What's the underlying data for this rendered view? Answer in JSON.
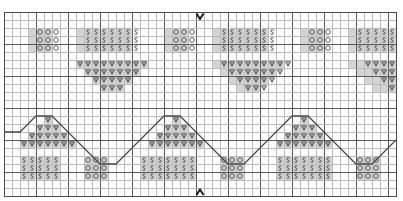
{
  "chart": {
    "type": "knitting-chart",
    "grid": {
      "columns": 49,
      "rows": 23,
      "cell_size": 8,
      "origin_x": 4,
      "origin_y": 12,
      "gridline_color": "#b9b9b9",
      "major_gridline_color": "#5a5a5a",
      "border_color": "#4a4a4a",
      "shaded_cell_color": "#d4d4d4",
      "background_color": "#ffffff",
      "major_every": 4
    },
    "symbols": {
      "yarn_over": {
        "name": "o",
        "glyph": "circle",
        "label": "yarn over"
      },
      "slip_stitch": {
        "name": "s",
        "glyph": "s-shape",
        "label": "slip stitch"
      },
      "decrease": {
        "name": "v",
        "glyph": "inverted-triangle",
        "label": "decrease"
      }
    },
    "markers": {
      "top": {
        "glyph": "V",
        "name": "repeat-start-marker",
        "col": 24,
        "row": 0
      },
      "bottom": {
        "glyph": "A",
        "name": "repeat-end-marker",
        "col": 24,
        "row": 22
      }
    },
    "zigzag": {
      "color": "#4a4a4a",
      "width": 1.3,
      "points": "0,15 2,15 4,13 6,13 8,15 10,17 12,19 14,19 16,17 18,15 20,13 22,13 24,15 26,17 28,19 30,19 32,17 34,15 36,13 38,13 40,15 42,17 44,19 46,19 48,17 49,16"
    },
    "rows": [
      {
        "index": 0,
        "cells": ""
      },
      {
        "index": 1,
        "cells": ""
      },
      {
        "index": 2,
        "cells": "....ooo...sssssss....ooo...sssssss....ooo...sssss"
      },
      {
        "index": 3,
        "cells": "....ooo...sssssss....ooo...sssssss....ooo...sssss"
      },
      {
        "index": 4,
        "cells": "....ooo...sssssss....ooo...sssssss....ooo...sssss"
      },
      {
        "index": 5,
        "cells": ""
      },
      {
        "index": 6,
        "cells": ".........vvvvvvvvv.........vvvvvvvvv.........vvvv"
      },
      {
        "index": 7,
        "cells": "..........vvvvvvv...........vvvvvvv...........vvv"
      },
      {
        "index": 8,
        "cells": "...........vvvvv.............vvvvv.............vv"
      },
      {
        "index": 9,
        "cells": "............vvv...............vvv...............v"
      },
      {
        "index": 10,
        "cells": ""
      },
      {
        "index": 11,
        "cells": ""
      },
      {
        "index": 12,
        "cells": ""
      },
      {
        "index": 13,
        "cells": ".....v...............v...............v..........."
      },
      {
        "index": 14,
        "cells": "....vvv.............vvv.............vvv.........."
      },
      {
        "index": 15,
        "cells": "...vvvvv...........vvvvv...........vvvvv........."
      },
      {
        "index": 16,
        "cells": "..vvvvvvv.........vvvvvvv.........vvvvvvv........"
      },
      {
        "index": 17,
        "cells": ""
      },
      {
        "index": 18,
        "cells": "..sssss...ooo....sssssss...ooo....sssssss...ooo.."
      },
      {
        "index": 19,
        "cells": "..sssss...ooo....sssssss...ooo....sssssss...ooo.."
      },
      {
        "index": 20,
        "cells": "..sssss...ooo....sssssss...ooo....sssssss...ooo.."
      },
      {
        "index": 21,
        "cells": ""
      },
      {
        "index": 22,
        "cells": ""
      }
    ],
    "blocks": [
      {
        "name": "top-yo-block-1",
        "symbol": "o",
        "col": 3,
        "row": 2,
        "w": 3,
        "h": 3
      },
      {
        "name": "top-slip-block-1",
        "symbol": "s",
        "col": 9,
        "row": 2,
        "w": 7,
        "h": 3
      },
      {
        "name": "top-yo-block-2",
        "symbol": "o",
        "col": 20,
        "row": 2,
        "w": 3,
        "h": 3
      },
      {
        "name": "top-slip-block-2",
        "symbol": "s",
        "col": 26,
        "row": 2,
        "w": 7,
        "h": 3
      },
      {
        "name": "top-yo-block-3",
        "symbol": "o",
        "col": 37,
        "row": 2,
        "w": 3,
        "h": 3
      },
      {
        "name": "top-slip-block-3",
        "symbol": "s",
        "col": 43,
        "row": 2,
        "w": 6,
        "h": 3
      },
      {
        "name": "upper-dec-tri-1",
        "symbol": "v",
        "col": 9,
        "row": 6,
        "w": 9,
        "h": 1
      },
      {
        "name": "upper-dec-tri-1b",
        "symbol": "v",
        "col": 10,
        "row": 7,
        "w": 7,
        "h": 1
      },
      {
        "name": "upper-dec-tri-1c",
        "symbol": "v",
        "col": 11,
        "row": 8,
        "w": 5,
        "h": 1
      },
      {
        "name": "upper-dec-tri-1d",
        "symbol": "v",
        "col": 12,
        "row": 9,
        "w": 3,
        "h": 1
      },
      {
        "name": "upper-dec-tri-2",
        "symbol": "v",
        "col": 26,
        "row": 6,
        "w": 9,
        "h": 1
      },
      {
        "name": "upper-dec-tri-2b",
        "symbol": "v",
        "col": 27,
        "row": 7,
        "w": 7,
        "h": 1
      },
      {
        "name": "upper-dec-tri-2c",
        "symbol": "v",
        "col": 28,
        "row": 8,
        "w": 5,
        "h": 1
      },
      {
        "name": "upper-dec-tri-2d",
        "symbol": "v",
        "col": 29,
        "row": 9,
        "w": 3,
        "h": 1
      },
      {
        "name": "upper-dec-tri-3",
        "symbol": "v",
        "col": 43,
        "row": 6,
        "w": 6,
        "h": 1
      },
      {
        "name": "upper-dec-tri-3b",
        "symbol": "v",
        "col": 44,
        "row": 7,
        "w": 5,
        "h": 1
      },
      {
        "name": "upper-dec-tri-3c",
        "symbol": "v",
        "col": 45,
        "row": 8,
        "w": 4,
        "h": 1
      },
      {
        "name": "upper-dec-tri-3d",
        "symbol": "v",
        "col": 46,
        "row": 9,
        "w": 3,
        "h": 1
      },
      {
        "name": "lower-dec-tri-1",
        "symbol": "v",
        "col": 5,
        "row": 13,
        "w": 1,
        "h": 1
      },
      {
        "name": "lower-dec-tri-1b",
        "symbol": "v",
        "col": 4,
        "row": 14,
        "w": 3,
        "h": 1
      },
      {
        "name": "lower-dec-tri-1c",
        "symbol": "v",
        "col": 3,
        "row": 15,
        "w": 5,
        "h": 1
      },
      {
        "name": "lower-dec-tri-1d",
        "symbol": "v",
        "col": 2,
        "row": 16,
        "w": 7,
        "h": 1
      },
      {
        "name": "lower-dec-tri-2",
        "symbol": "v",
        "col": 21,
        "row": 13,
        "w": 1,
        "h": 1
      },
      {
        "name": "lower-dec-tri-2b",
        "symbol": "v",
        "col": 20,
        "row": 14,
        "w": 3,
        "h": 1
      },
      {
        "name": "lower-dec-tri-2c",
        "symbol": "v",
        "col": 19,
        "row": 15,
        "w": 5,
        "h": 1
      },
      {
        "name": "lower-dec-tri-2d",
        "symbol": "v",
        "col": 18,
        "row": 16,
        "w": 7,
        "h": 1
      },
      {
        "name": "lower-dec-tri-3",
        "symbol": "v",
        "col": 37,
        "row": 13,
        "w": 1,
        "h": 1
      },
      {
        "name": "lower-dec-tri-3b",
        "symbol": "v",
        "col": 36,
        "row": 14,
        "w": 3,
        "h": 1
      },
      {
        "name": "lower-dec-tri-3c",
        "symbol": "v",
        "col": 35,
        "row": 15,
        "w": 5,
        "h": 1
      },
      {
        "name": "lower-dec-tri-3d",
        "symbol": "v",
        "col": 34,
        "row": 16,
        "w": 7,
        "h": 1
      },
      {
        "name": "bottom-slip-block-1",
        "symbol": "s",
        "col": 2,
        "row": 18,
        "w": 5,
        "h": 3
      },
      {
        "name": "bottom-yo-block-1",
        "symbol": "o",
        "col": 10,
        "row": 18,
        "w": 3,
        "h": 3
      },
      {
        "name": "bottom-slip-block-2",
        "symbol": "s",
        "col": 17,
        "row": 18,
        "w": 7,
        "h": 3
      },
      {
        "name": "bottom-yo-block-2",
        "symbol": "o",
        "col": 27,
        "row": 18,
        "w": 3,
        "h": 3
      },
      {
        "name": "bottom-slip-block-3",
        "symbol": "s",
        "col": 34,
        "row": 18,
        "w": 7,
        "h": 3
      },
      {
        "name": "bottom-yo-block-3",
        "symbol": "o",
        "col": 44,
        "row": 18,
        "w": 3,
        "h": 3
      }
    ]
  }
}
